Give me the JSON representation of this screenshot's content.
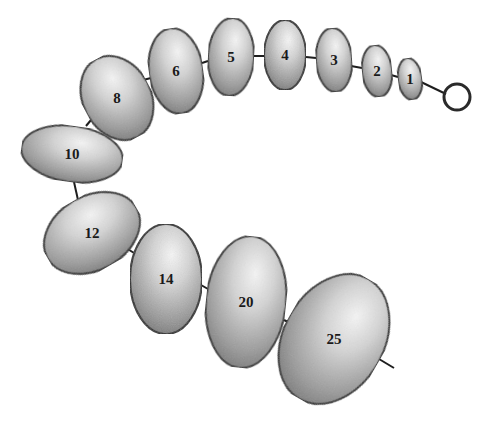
{
  "diagram": {
    "type": "bead-chain",
    "colors": {
      "outline": "#2a2a2a",
      "highlight": "#f4f4f4",
      "shade": "#7a7a7a",
      "connector": "#1e1e1e",
      "background": "#ffffff"
    },
    "ring": {
      "cx": 457,
      "cy": 97,
      "r": 13
    },
    "beads": [
      {
        "label": "1",
        "cx": 410,
        "cy": 79,
        "rx": 12,
        "ry": 21,
        "rot": -8
      },
      {
        "label": "2",
        "cx": 377,
        "cy": 71,
        "rx": 15,
        "ry": 26,
        "rot": -6
      },
      {
        "label": "3",
        "cx": 334,
        "cy": 60,
        "rx": 18,
        "ry": 32,
        "rot": -4
      },
      {
        "label": "4",
        "cx": 285,
        "cy": 55,
        "rx": 21,
        "ry": 35,
        "rot": 0
      },
      {
        "label": "5",
        "cx": 231,
        "cy": 57,
        "rx": 23,
        "ry": 39,
        "rot": 3
      },
      {
        "label": "6",
        "cx": 176,
        "cy": 71,
        "rx": 27,
        "ry": 43,
        "rot": -8
      },
      {
        "label": "8",
        "cx": 117,
        "cy": 98,
        "rx": 34,
        "ry": 44,
        "rot": -28
      },
      {
        "label": "10",
        "cx": 72,
        "cy": 154,
        "rx": 51,
        "ry": 28,
        "rot": 8
      },
      {
        "label": "12",
        "cx": 92,
        "cy": 233,
        "rx": 51,
        "ry": 37,
        "rot": -30
      },
      {
        "label": "14",
        "cx": 166,
        "cy": 279,
        "rx": 36,
        "ry": 55,
        "rot": 0
      },
      {
        "label": "20",
        "cx": 246,
        "cy": 302,
        "rx": 40,
        "ry": 66,
        "rot": 6
      },
      {
        "label": "25",
        "cx": 334,
        "cy": 339,
        "rx": 50,
        "ry": 69,
        "rot": 30
      }
    ],
    "connectors": [
      {
        "x1": 421,
        "y1": 82,
        "x2": 446,
        "y2": 94
      },
      {
        "x1": 391,
        "y1": 75,
        "x2": 398,
        "y2": 77
      },
      {
        "x1": 351,
        "y1": 66,
        "x2": 362,
        "y2": 68
      },
      {
        "x1": 306,
        "y1": 57,
        "x2": 316,
        "y2": 58
      },
      {
        "x1": 254,
        "y1": 56,
        "x2": 264,
        "y2": 56
      },
      {
        "x1": 202,
        "y1": 63,
        "x2": 208,
        "y2": 61
      },
      {
        "x1": 143,
        "y1": 80,
        "x2": 151,
        "y2": 78
      },
      {
        "x1": 86,
        "y1": 126,
        "x2": 96,
        "y2": 114
      },
      {
        "x1": 74,
        "y1": 182,
        "x2": 78,
        "y2": 200
      },
      {
        "x1": 123,
        "y1": 246,
        "x2": 134,
        "y2": 253
      },
      {
        "x1": 201,
        "y1": 285,
        "x2": 208,
        "y2": 289
      },
      {
        "x1": 284,
        "y1": 320,
        "x2": 292,
        "y2": 324
      },
      {
        "x1": 374,
        "y1": 356,
        "x2": 394,
        "y2": 368
      }
    ]
  }
}
